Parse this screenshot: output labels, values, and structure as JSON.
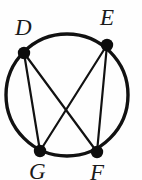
{
  "figure": {
    "name": "circle-with-inscribed-quadrilateral-and-diagonals",
    "background_color": "#fefefe",
    "stroke_color": "#111111",
    "circle": {
      "center_x": 67,
      "center_y": 95,
      "radius": 61,
      "stroke_width": 3.4
    },
    "vertices": [
      {
        "id": "D",
        "label": "D",
        "x": 24,
        "y": 53,
        "dot_radius": 6.2
      },
      {
        "id": "E",
        "label": "E",
        "x": 107,
        "y": 45,
        "dot_radius": 6.2
      },
      {
        "id": "G",
        "label": "G",
        "x": 40,
        "y": 151,
        "dot_radius": 6.2
      },
      {
        "id": "F",
        "label": "F",
        "x": 97,
        "y": 152,
        "dot_radius": 6.2
      }
    ],
    "chords": [
      {
        "id": "D-G",
        "from": "D",
        "to": "G",
        "stroke_width": 2.2
      },
      {
        "id": "E-F",
        "from": "E",
        "to": "F",
        "stroke_width": 2.2
      },
      {
        "id": "D-F",
        "from": "D",
        "to": "F",
        "stroke_width": 2.2
      },
      {
        "id": "E-G",
        "from": "E",
        "to": "G",
        "stroke_width": 2.2
      }
    ],
    "labels": [
      {
        "id": "D",
        "text": "D",
        "left": 15,
        "top": 16,
        "font_size": 23
      },
      {
        "id": "E",
        "text": "E",
        "left": 100,
        "top": 6,
        "font_size": 23
      },
      {
        "id": "G",
        "text": "G",
        "left": 29,
        "top": 160,
        "font_size": 23
      },
      {
        "id": "F",
        "text": "F",
        "left": 90,
        "top": 161,
        "font_size": 23
      }
    ]
  }
}
